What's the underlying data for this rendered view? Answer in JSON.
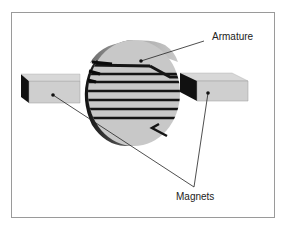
{
  "figure": {
    "labels": {
      "armature": "Armature",
      "magnets": "Magnets"
    },
    "colors": {
      "frame": "#9a9a9a",
      "cylinder_face": "#c8c8c8",
      "cylinder_side": "#8a8a8a",
      "cylinder_dark": "#1a1a1a",
      "magnet_face": "#cfcfcf",
      "magnet_top": "#dcdcdc",
      "magnet_side": "#111111",
      "winding": "#151515",
      "leader": "#222222"
    }
  }
}
